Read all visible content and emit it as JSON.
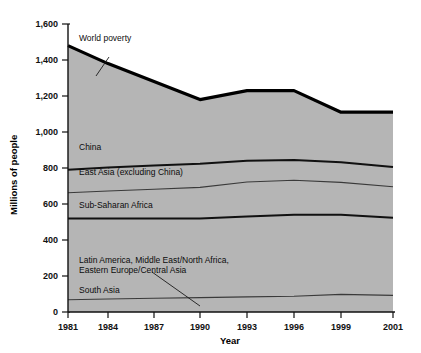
{
  "chart_data": {
    "type": "area",
    "title": "",
    "xlabel": "Year",
    "ylabel": "Millions of people",
    "x": [
      1981,
      1984,
      1987,
      1990,
      1993,
      1996,
      1999,
      2001
    ],
    "xtick_labels": [
      "1981",
      "1984",
      "1987",
      "1990",
      "1993",
      "1996",
      "1999",
      "2001"
    ],
    "ytick_labels": [
      "0",
      "200",
      "400",
      "600",
      "800",
      "1,000",
      "1,200",
      "1,400",
      "1,600"
    ],
    "ytick_values": [
      0,
      200,
      400,
      600,
      800,
      1000,
      1200,
      1400,
      1600
    ],
    "ylim": [
      0,
      1600
    ],
    "xlim": [
      1981,
      2001
    ],
    "grid": false,
    "legend_position": "inline-annotations",
    "stacked": true,
    "stack_order_bottom_to_top": [
      "South Asia",
      "Latin America, Middle East/North Africa, Eastern Europe/Central Asia",
      "Sub-Saharan Africa",
      "East Asia (excluding China)",
      "China"
    ],
    "series": [
      {
        "name": "South Asia",
        "label": "South Asia",
        "values": [
          68,
          72,
          76,
          80,
          84,
          88,
          98,
          92
        ]
      },
      {
        "name": "Latin America, Middle East/North Africa, Eastern Europe/Central Asia",
        "label": "Latin America, Middle East/North Africa,",
        "label_line2": "Eastern Europe/Central Asia",
        "values": [
          452,
          448,
          444,
          440,
          446,
          452,
          442,
          432
        ]
      },
      {
        "name": "Sub-Saharan Africa",
        "label": "Sub-Saharan Africa",
        "values": [
          142,
          152,
          162,
          172,
          192,
          192,
          180,
          172
        ]
      },
      {
        "name": "East Asia (excluding China)",
        "label": "East Asia (excluding China)",
        "values": [
          128,
          130,
          132,
          132,
          118,
          112,
          112,
          110
        ]
      },
      {
        "name": "China",
        "label": "China",
        "values": [
          690,
          578,
          466,
          356,
          390,
          386,
          278,
          304
        ]
      }
    ],
    "total_series": {
      "name": "World poverty",
      "label": "World poverty",
      "values": [
        1480,
        1380,
        1280,
        1180,
        1230,
        1230,
        1110,
        1110
      ]
    },
    "colors": {
      "band_fill": "#b5b5b5",
      "total_line": "#000000",
      "separator_thick": "#111111",
      "separator_thin": "#3a3a3a",
      "axis": "#111111",
      "text": "#111111",
      "background": "#ffffff"
    }
  },
  "annotations": [
    {
      "name": "world-poverty",
      "text": "World poverty"
    },
    {
      "name": "china",
      "text": "China"
    },
    {
      "name": "east-asia",
      "text": "East Asia (excluding China)"
    },
    {
      "name": "sub-saharan-africa",
      "text": "Sub-Saharan Africa"
    },
    {
      "name": "latin-america-line1",
      "text": "Latin America, Middle East/North Africa,"
    },
    {
      "name": "latin-america-line2",
      "text": "Eastern Europe/Central Asia"
    },
    {
      "name": "south-asia",
      "text": "South Asia"
    }
  ],
  "axes": {
    "y_title": "Millions of people",
    "x_title": "Year"
  }
}
